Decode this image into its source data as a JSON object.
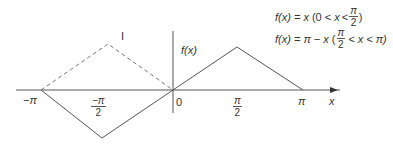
{
  "diagram": {
    "type": "function-graph",
    "colors": {
      "line": "#555555",
      "text": "#333333",
      "background": "#ffffff"
    },
    "axes": {
      "x_label": "x",
      "y_label": "f(x)",
      "origin_label": "0"
    },
    "ticks": {
      "neg_pi": "−π",
      "neg_half_pi_num": "−π",
      "neg_half_pi_den": "2",
      "half_pi_num": "π",
      "half_pi_den": "2",
      "pi": "π"
    },
    "dashed_marker": "I",
    "equations": [
      {
        "lhs": "f(x) = x",
        "cond_open": "(0 <",
        "cond_var": "x",
        "cond_lt": "<",
        "frac_num": "π",
        "frac_den": "2",
        "cond_close": ")"
      },
      {
        "lhs": "f(x) = π − x",
        "cond_open": "(",
        "frac_num": "π",
        "frac_den": "2",
        "cond_mid": "< x < π)"
      }
    ]
  }
}
